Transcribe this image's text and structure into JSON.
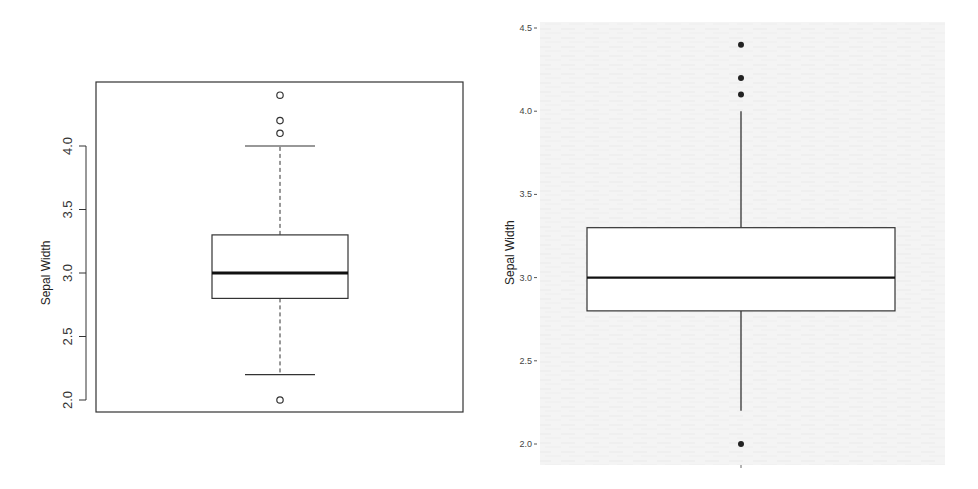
{
  "chart_data": [
    {
      "type": "box",
      "panel": "left",
      "style": "base R graphics boxplot (hollow outlier circles, dashed whiskers, framed plot area)",
      "title": "",
      "xlabel": "",
      "ylabel": "Sepal Width",
      "ylim": [
        1.9,
        4.5
      ],
      "yticks": [
        "2.0",
        "2.5",
        "3.0",
        "3.5",
        "4.0"
      ],
      "ytick_values": [
        2.0,
        2.5,
        3.0,
        3.5,
        4.0
      ],
      "tick_label_rotation": 90,
      "grid": false,
      "stats": {
        "whisker_low": 2.2,
        "q1": 2.8,
        "median": 3.0,
        "q3": 3.3,
        "whisker_high": 4.0
      },
      "outliers": [
        4.4,
        4.2,
        4.1,
        2.0
      ],
      "outlier_marker": "hollow-circle"
    },
    {
      "type": "box",
      "panel": "right",
      "style": "ggplot2-like boxplot (filled outlier dots, solid whiskers, light textured background)",
      "title": "",
      "xlabel": "",
      "ylabel": "Sepal Width",
      "ylim": [
        1.95,
        4.5
      ],
      "yticks": [
        "2.0",
        "2.5",
        "3.0",
        "3.5",
        "4.0",
        "4.5"
      ],
      "ytick_values": [
        2.0,
        2.5,
        3.0,
        3.5,
        4.0,
        4.5
      ],
      "grid": false,
      "stats": {
        "whisker_low": 2.2,
        "q1": 2.8,
        "median": 3.0,
        "q3": 3.3,
        "whisker_high": 4.0
      },
      "outliers": [
        4.4,
        4.2,
        4.1,
        2.0
      ],
      "outlier_marker": "filled-dot"
    }
  ],
  "labels": {
    "left_ylabel": "Sepal Width",
    "right_ylabel": "Sepal Width"
  },
  "colors": {
    "line": "#333333",
    "median": "#111111",
    "right_background": "#f4f4f4",
    "text": "#333333"
  }
}
